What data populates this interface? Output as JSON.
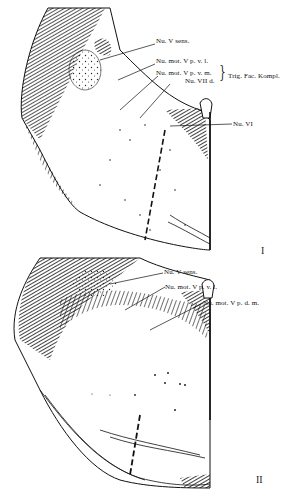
{
  "figure": {
    "section_I": {
      "numeral": "I",
      "labels": [
        {
          "text": "Nu. V sens."
        },
        {
          "text": "Nu. mot. V p. v. l."
        },
        {
          "text": "Nu. mot. V p. v. m."
        },
        {
          "text": "Nu. VII d."
        },
        {
          "text": "Nu. VI"
        }
      ],
      "group_label": "Trig. Fac. Kompl."
    },
    "section_II": {
      "numeral": "II",
      "labels": [
        {
          "text": "Nu. V sens."
        },
        {
          "text": "Nu. mot. V p. v. l."
        },
        {
          "text": "Nu. mot. V p. d. m."
        }
      ]
    },
    "colors": {
      "ink": "#111111",
      "paper": "#ffffff"
    }
  }
}
